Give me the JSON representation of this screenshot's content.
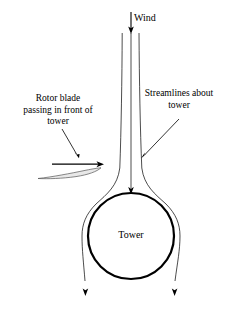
{
  "figure": {
    "type": "schematic-diagram",
    "background_color": "#ffffff",
    "line_color": "#000000",
    "blade_fill_color": "#e8e8e8"
  },
  "labels": {
    "wind": "Wind",
    "rotor_blade": "Rotor blade\npassing in front of\ntower",
    "streamlines": "Streamlines about\ntower",
    "tower": "Tower"
  },
  "elements": {
    "wind_arrow": {
      "name": "wind-direction-arrow",
      "direction": "down",
      "from_y": 12,
      "to_y": 33,
      "x": 131
    },
    "tower": {
      "name": "tower-cross-section",
      "shape": "circle",
      "center_x": 131,
      "center_y": 236,
      "radius": 43
    },
    "streamlines": {
      "name": "streamlines-about-tower",
      "count": 3,
      "top_x_positions": [
        122,
        131,
        139
      ],
      "bottom_x_positions": [
        85,
        131,
        175
      ],
      "stagnation_arrow_y": 193
    },
    "rotor_blade": {
      "name": "rotor-blade-airfoil",
      "chord_left_x": 38,
      "chord_right_x": 101,
      "y": 173
    },
    "blade_motion_arrow": {
      "name": "blade-motion-arrow",
      "direction": "right",
      "from_x": 52,
      "to_x": 103,
      "y": 164
    }
  }
}
